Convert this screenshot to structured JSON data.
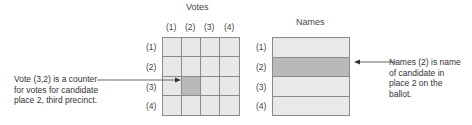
{
  "votes": {
    "title": "Votes",
    "col_labels": [
      "(1)",
      "(2)",
      "(3)",
      "(4)"
    ],
    "row_labels": [
      "(1)",
      "(2)",
      "(3)",
      "(4)"
    ],
    "highlight_cell": {
      "row": 3,
      "col": 2
    },
    "annotation": [
      "Vote (3,2) is a counter",
      "for votes for candidate",
      "place 2, third precinct."
    ]
  },
  "names": {
    "title": "Names",
    "row_labels": [
      "(1)",
      "(2)",
      "(3)",
      "(4)"
    ],
    "highlight_row": 2,
    "annotation": [
      "Names (2) is name",
      "of candidate in",
      "place 2 on the",
      "ballot."
    ]
  },
  "colors": {
    "cell_fill": "#e9e9e9",
    "highlight_fill": "#b9b9b9",
    "grid_line": "#8a8a8a"
  }
}
